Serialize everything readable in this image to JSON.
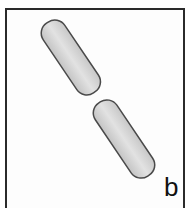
{
  "figure": {
    "panel_label": "b",
    "colors": {
      "frame": "#2a2a2a",
      "cell_fill": "#d6d6d6",
      "cell_outline": "#4a4a4a",
      "background": "#fdfdfd"
    }
  }
}
